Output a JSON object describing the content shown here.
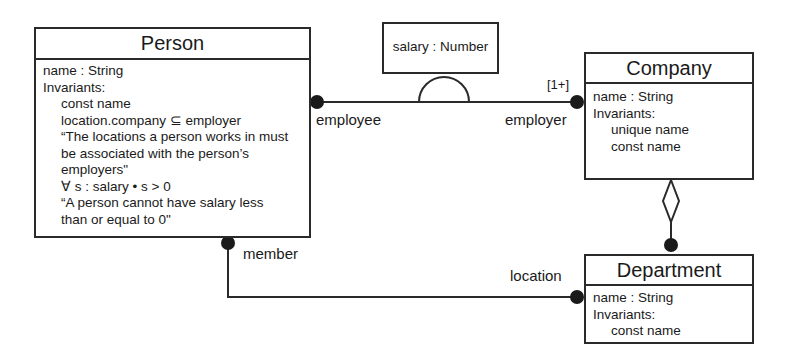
{
  "diagram": {
    "classes": {
      "person": {
        "name": "Person",
        "attributes": [
          "name : String"
        ],
        "invariants_label": "Invariants:",
        "invariants": [
          "const name",
          "location.company ⊆ employer",
          "“The locations a person works in must",
          "be associated with the person’s",
          "employers\"",
          "∀ s : salary • s > 0",
          "“A person cannot have salary less",
          "than or equal to 0\""
        ]
      },
      "company": {
        "name": "Company",
        "attributes": [
          "name : String"
        ],
        "invariants_label": "Invariants:",
        "invariants": [
          "unique name",
          "const name"
        ]
      },
      "department": {
        "name": "Department",
        "attributes": [
          "name : String"
        ],
        "invariants_label": "Invariants:",
        "invariants": [
          "const name"
        ]
      }
    },
    "association_class": {
      "label": "salary : Number"
    },
    "roles": {
      "employee": "employee",
      "employer": "employer",
      "employer_multiplicity": "[1+]",
      "member": "member",
      "location": "location"
    },
    "colors": {
      "line": "#2a2a2a",
      "background": "#ffffff"
    }
  }
}
